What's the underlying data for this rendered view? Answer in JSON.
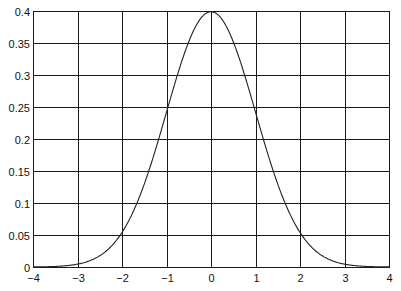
{
  "chart_data": {
    "type": "line",
    "title": "",
    "xlabel": "",
    "ylabel": "",
    "xlim": [
      -4,
      4
    ],
    "ylim": [
      0,
      0.4
    ],
    "grid": true,
    "legend": null,
    "x_ticks": [
      -4,
      -3,
      -2,
      -1,
      0,
      1,
      2,
      3,
      4
    ],
    "x_tick_labels": [
      "−4",
      "−3",
      "−2",
      "−1",
      "0",
      "1",
      "2",
      "3",
      "4"
    ],
    "y_ticks": [
      0,
      0.05,
      0.1,
      0.15,
      0.2,
      0.25,
      0.3,
      0.35,
      0.4
    ],
    "y_tick_labels": [
      "0",
      "0.05",
      "0.1",
      "0.15",
      "0.2",
      "0.25",
      "0.3",
      "0.35",
      "0.4"
    ],
    "series": [
      {
        "name": "standard normal pdf",
        "color": "#222222",
        "x": [
          -4,
          -3.5,
          -3,
          -2.5,
          -2,
          -1.5,
          -1,
          -0.5,
          0,
          0.5,
          1,
          1.5,
          2,
          2.5,
          3,
          3.5,
          4
        ],
        "y": [
          0.0001,
          0.0009,
          0.0044,
          0.0175,
          0.054,
          0.1295,
          0.242,
          0.3521,
          0.3989,
          0.3521,
          0.242,
          0.1295,
          0.054,
          0.0175,
          0.0044,
          0.0009,
          0.0001
        ]
      }
    ]
  },
  "style": {
    "background": "#ffffff",
    "grid_color": "#1a1a1a",
    "axis_color": "#1a1a1a",
    "plot_area": {
      "left": 33,
      "top": 11,
      "right": 389,
      "bottom": 267
    }
  }
}
